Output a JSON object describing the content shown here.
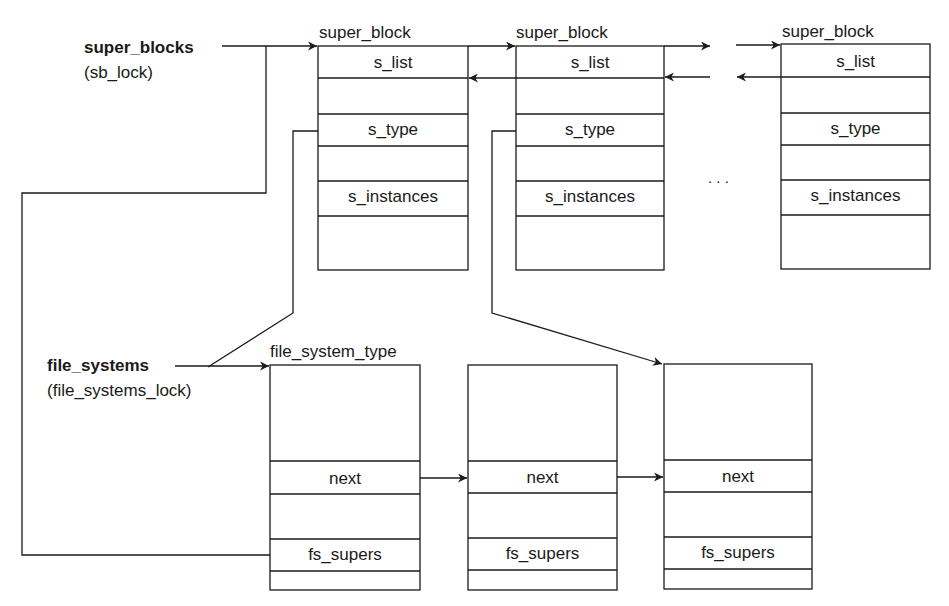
{
  "roots": {
    "super_blocks": {
      "name": "super_blocks",
      "lock": "(sb_lock)"
    },
    "file_systems": {
      "name": "file_systems",
      "lock": "(file_systems_lock)"
    }
  },
  "super_block_list": {
    "struct_name": "super_block",
    "ellipsis": ". . .",
    "blocks": [
      {
        "title": "super_block",
        "fields": [
          "s_list",
          "",
          "s_type",
          "",
          "s_instances",
          ""
        ]
      },
      {
        "title": "super_block",
        "fields": [
          "s_list",
          "",
          "s_type",
          "",
          "s_instances",
          ""
        ]
      },
      {
        "title": "super_block",
        "fields": [
          "s_list",
          "",
          "s_type",
          "",
          "s_instances",
          ""
        ]
      }
    ]
  },
  "file_system_type_list": {
    "struct_name": "file_system_type",
    "blocks": [
      {
        "title": "file_system_type",
        "fields": [
          "",
          "next",
          "",
          "fs_supers",
          ""
        ]
      },
      {
        "title": "",
        "fields": [
          "",
          "next",
          "",
          "fs_supers",
          ""
        ]
      },
      {
        "title": "",
        "fields": [
          "",
          "next",
          "",
          "fs_supers",
          ""
        ]
      }
    ]
  },
  "colors": {
    "line": "#1a1a1a",
    "background": "#ffffff"
  }
}
